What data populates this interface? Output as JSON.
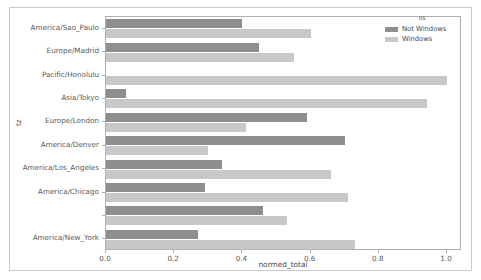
{
  "chart_data": {
    "type": "bar",
    "orientation": "horizontal",
    "title": "",
    "xlabel": "normed_total",
    "ylabel": "tz",
    "xlim": [
      0.0,
      1.0
    ],
    "xticks": [
      0.0,
      0.2,
      0.4,
      0.6,
      0.8,
      1.0
    ],
    "xtick_labels": [
      "0.0",
      "0.2",
      "0.4",
      "0.6",
      "0.8",
      "1.0"
    ],
    "grid": false,
    "legend": {
      "title": "os",
      "position": "upper right outside",
      "entries": [
        "Not Windows",
        "Windows"
      ]
    },
    "categories": [
      "America/Sao_Paulo",
      "Europe/Madrid",
      "Pacific/Honolulu",
      "Asia/Tokyo",
      "Europe/London",
      "America/Denver",
      "America/Los_Angeles",
      "America/Chicago",
      "",
      "America/New_York"
    ],
    "series": [
      {
        "name": "Not Windows",
        "color": "#8e8e8e",
        "values": [
          0.4,
          0.45,
          0.0,
          0.06,
          0.59,
          0.7,
          0.34,
          0.29,
          0.46,
          0.27
        ]
      },
      {
        "name": "Windows",
        "color": "#c8c8c8",
        "values": [
          0.6,
          0.55,
          1.0,
          0.94,
          0.41,
          0.3,
          0.66,
          0.71,
          0.53,
          0.73
        ]
      }
    ]
  }
}
